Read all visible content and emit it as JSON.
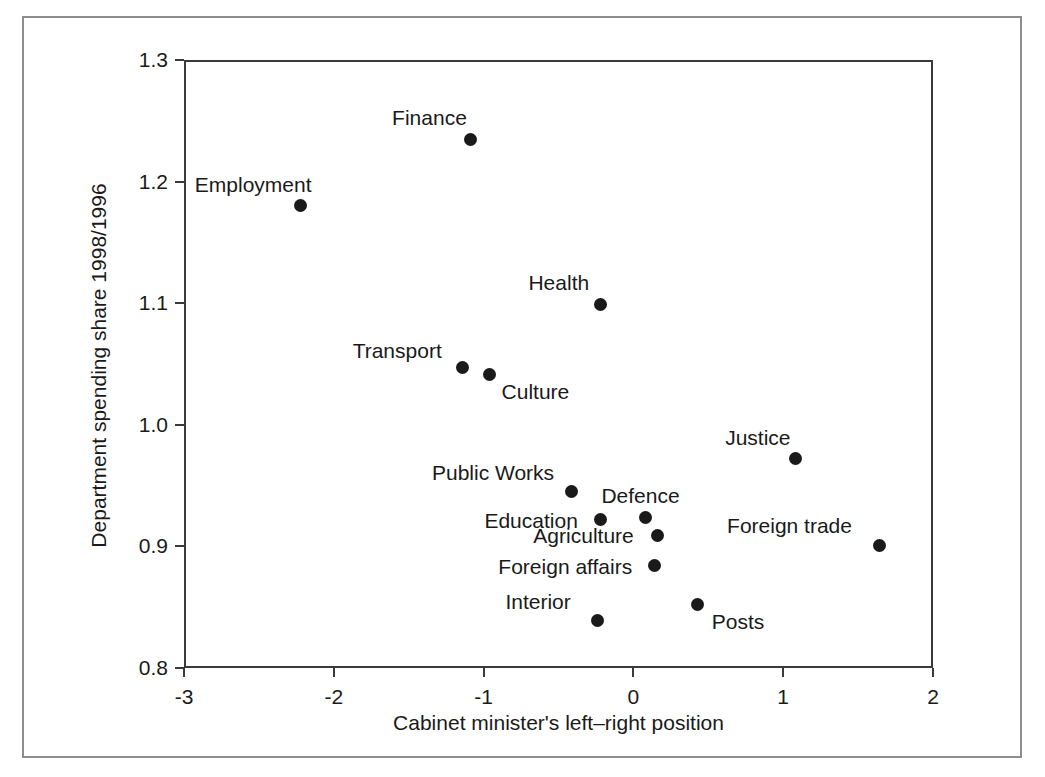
{
  "chart_data": {
    "type": "scatter",
    "title": "",
    "xlabel": "Cabinet minister's left–right position",
    "ylabel": "Department spending share 1998/1996",
    "xlim": [
      -3,
      2
    ],
    "ylim": [
      0.8,
      1.3
    ],
    "xticks": [
      "-3",
      "-2",
      "-1",
      "0",
      "1",
      "2"
    ],
    "xtick_values": [
      -3,
      -2,
      -1,
      0,
      1,
      2
    ],
    "yticks": [
      "0.8",
      "0.9",
      "1.0",
      "1.1",
      "1.2",
      "1.3"
    ],
    "ytick_values": [
      0.8,
      0.9,
      1.0,
      1.1,
      1.2,
      1.3
    ],
    "grid": false,
    "legend": "none",
    "marker": "filled-circle",
    "marker_color": "#1a1a1a",
    "points": [
      {
        "label": "Finance",
        "x": -1.09,
        "y": 1.235,
        "label_dx": -78,
        "label_dy": -32
      },
      {
        "label": "Employment",
        "x": -2.22,
        "y": 1.18,
        "label_dx": -106,
        "label_dy": -32
      },
      {
        "label": "Health",
        "x": -0.22,
        "y": 1.099,
        "label_dx": -72,
        "label_dy": -32
      },
      {
        "label": "Transport",
        "x": -1.14,
        "y": 1.047,
        "label_dx": -110,
        "label_dy": -28
      },
      {
        "label": "Culture",
        "x": -0.96,
        "y": 1.041,
        "label_dx": 12,
        "label_dy": 6
      },
      {
        "label": "Justice",
        "x": 1.08,
        "y": 0.972,
        "label_dx": -70,
        "label_dy": -32
      },
      {
        "label": "Public Works",
        "x": -0.41,
        "y": 0.945,
        "label_dx": -140,
        "label_dy": -30
      },
      {
        "label": "Defence",
        "x": 0.08,
        "y": 0.924,
        "label_dx": -44,
        "label_dy": -32
      },
      {
        "label": "Education",
        "x": -0.22,
        "y": 0.922,
        "label_dx": -116,
        "label_dy": -10
      },
      {
        "label": "Agriculture",
        "x": 0.16,
        "y": 0.909,
        "label_dx": -124,
        "label_dy": -10
      },
      {
        "label": "Foreign trade",
        "x": 1.64,
        "y": 0.901,
        "label_dx": -152,
        "label_dy": -30
      },
      {
        "label": "Foreign affairs",
        "x": 0.14,
        "y": 0.884,
        "label_dx": -156,
        "label_dy": -10
      },
      {
        "label": "Posts",
        "x": 0.43,
        "y": 0.852,
        "label_dx": 14,
        "label_dy": 6
      },
      {
        "label": "Interior",
        "x": -0.24,
        "y": 0.839,
        "label_dx": -92,
        "label_dy": -30
      }
    ]
  }
}
